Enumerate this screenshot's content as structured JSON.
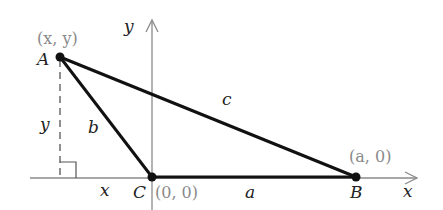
{
  "diagram": {
    "title": "",
    "axes": {
      "x_label": "x",
      "y_label": "y",
      "color": "#8a8a8a"
    },
    "points": [
      {
        "name": "A",
        "label": "A",
        "coord_label": "(x, y)"
      },
      {
        "name": "B",
        "label": "B",
        "coord_label": "(a, 0)"
      },
      {
        "name": "C",
        "label": "C",
        "coord_label": "(0, 0)"
      }
    ],
    "sides": {
      "a": "a",
      "b": "b",
      "c": "c"
    },
    "segment_labels": {
      "horizontal": "x",
      "vertical": "y"
    },
    "colors": {
      "triangle": "#111111",
      "axis": "#8a8a8a",
      "coords": "#8a8a8a",
      "dashed": "#555555"
    }
  }
}
